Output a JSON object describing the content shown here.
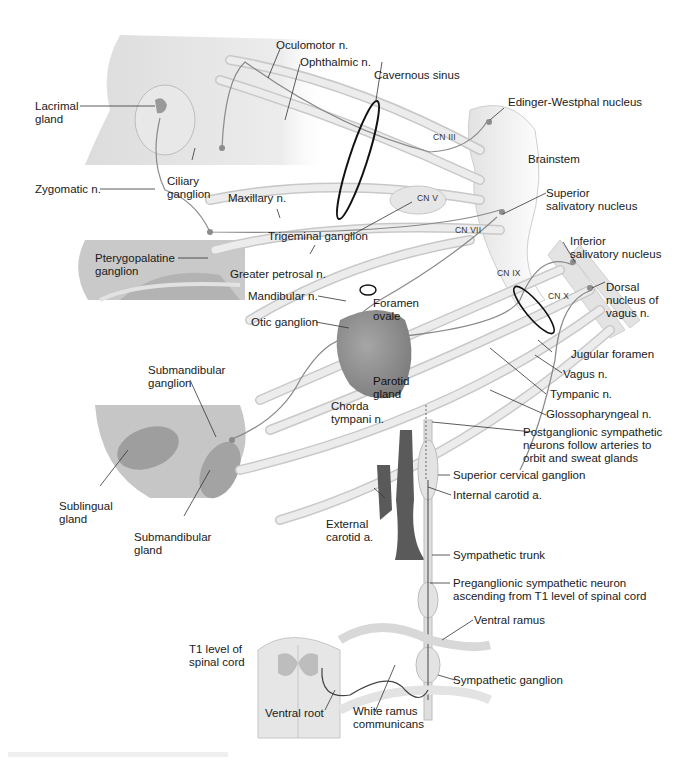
{
  "figure": {
    "type": "anatomical-illustration"
  },
  "labels": {
    "oculomotor": "Oculomotor n.",
    "ophthalmic": "Ophthalmic n.",
    "cavernous_sinus": "Cavernous sinus",
    "lacrimal_gland": "Lacrimal\ngland",
    "edinger_westphal": "Edinger-Westphal nucleus",
    "brainstem": "Brainstem",
    "zygomatic": "Zygomatic n.",
    "ciliary_ganglion": "Ciliary\nganglion",
    "maxillary": "Maxillary n.",
    "superior_salivatory": "Superior\nsalivatory nucleus",
    "trigeminal_ganglion": "Trigeminal ganglion",
    "pterygopalatine": "Pterygopalatine\nganglion",
    "greater_petrosal": "Greater petrosal n.",
    "inferior_salivatory": "Inferior\nsalivatory nucleus",
    "dorsal_vagus": "Dorsal\nnucleus of\nvagus n.",
    "mandibular": "Mandibular n.",
    "foramen_ovale": "Foramen\novale",
    "otic_ganglion": "Otic ganglion",
    "jugular_foramen": "Jugular foramen",
    "vagus": "Vagus n.",
    "submandibular_ganglion": "Submandibular\nganglion",
    "parotid_gland": "Parotid\ngland",
    "tympanic": "Tympanic n.",
    "chorda_tympani": "Chorda\ntympani n.",
    "glossopharyngeal": "Glossopharyngeal n.",
    "postganglionic": "Postganglionic sympathetic\nneurons follow arteries to\norbit and sweat glands",
    "superior_cervical": "Superior cervical ganglion",
    "internal_carotid": "Internal carotid a.",
    "sublingual_gland": "Sublingual\ngland",
    "external_carotid": "External\ncarotid a.",
    "submandibular_gland": "Submandibular\ngland",
    "sympathetic_trunk": "Sympathetic trunk",
    "preganglionic": "Preganglionic sympathetic neuron\nascending from T1 level of spinal cord",
    "ventral_ramus": "Ventral ramus",
    "t1_level": "T1 level of\nspinal cord",
    "sympathetic_ganglion": "Sympathetic ganglion",
    "ventral_root": "Ventral root",
    "white_ramus": "White ramus\ncommunicans"
  },
  "cranial_nerves": {
    "cn3": "CN III",
    "cn5": "CN V",
    "cn7": "CN VII",
    "cn9": "CN IX",
    "cn10": "CN X"
  },
  "colors": {
    "nerve_fill": "#e6e6e6",
    "nerve_edge": "#bdbdbd",
    "tissue": "#cfcfcf",
    "gland": "#8c8c8c",
    "artery": "#5a5a5a",
    "leader": "#333333",
    "sinus_ring": "#111111"
  }
}
